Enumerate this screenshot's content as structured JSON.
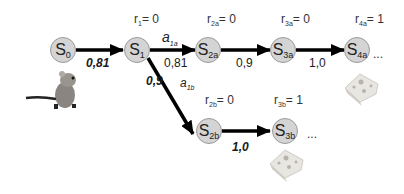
{
  "diagram": {
    "type": "markov-decision-chain",
    "nodes": [
      {
        "id": "s0",
        "base": "S",
        "sub": "0",
        "reward": null
      },
      {
        "id": "s1",
        "base": "S",
        "sub": "1",
        "reward_label": "r",
        "reward_sub": "1",
        "reward_value": "= 0"
      },
      {
        "id": "s2a",
        "base": "S",
        "sub": "2a",
        "reward_label": "r",
        "reward_sub": "2a",
        "reward_value": "= 0"
      },
      {
        "id": "s3a",
        "base": "S",
        "sub": "3a",
        "reward_label": "r",
        "reward_sub": "3a",
        "reward_value": "= 0"
      },
      {
        "id": "s4a",
        "base": "S",
        "sub": "4a",
        "reward_label": "r",
        "reward_sub": "4a",
        "reward_value": "= 1"
      },
      {
        "id": "s2b",
        "base": "S",
        "sub": "2b",
        "reward_label": "r",
        "reward_sub": "2b",
        "reward_value": "= 0"
      },
      {
        "id": "s3b",
        "base": "S",
        "sub": "3b",
        "reward_label": "r",
        "reward_sub": "3b",
        "reward_value": "= 1"
      }
    ],
    "edges": [
      {
        "from": "s0",
        "to": "s1",
        "value": "0,81",
        "bold": true
      },
      {
        "from": "s1",
        "to": "s2a",
        "value": "0,81",
        "bold": false,
        "action": "a",
        "action_sub": "1a"
      },
      {
        "from": "s2a",
        "to": "s3a",
        "value": "0,9",
        "bold": false
      },
      {
        "from": "s3a",
        "to": "s4a",
        "value": "1,0",
        "bold": false
      },
      {
        "from": "s1",
        "to": "s2b",
        "value": "0,9",
        "bold": true,
        "action": "a",
        "action_sub": "1b"
      },
      {
        "from": "s2b",
        "to": "s3b",
        "value": "1,0",
        "bold": true
      }
    ],
    "ellipsis": "...",
    "images": [
      "mouse",
      "cheese-4a",
      "cheese-3b"
    ]
  }
}
